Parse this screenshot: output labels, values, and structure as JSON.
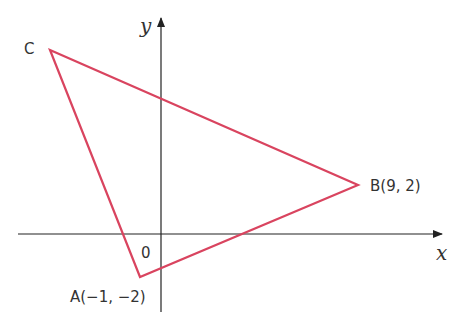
{
  "diagram": {
    "axes": {
      "x_label": "x",
      "y_label": "y",
      "origin_label": "0",
      "axis_color": "#222222"
    },
    "triangle": {
      "stroke_color": "#d9445f",
      "vertices": [
        {
          "name": "A",
          "label": "A(−1, −2)",
          "coords": [
            -1,
            -2
          ]
        },
        {
          "name": "B",
          "label": "B(9, 2)",
          "coords": [
            9,
            2
          ]
        },
        {
          "name": "C",
          "label": "C",
          "coords": null
        }
      ]
    }
  }
}
